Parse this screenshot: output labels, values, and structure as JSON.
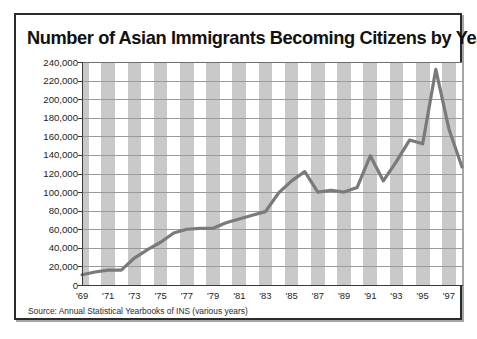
{
  "figure": {
    "title": "Number of Asian Immigrants Becoming Citizens by Year",
    "source": "Source: Annual Statistical Yearbooks of INS (various years)",
    "line_color": "#7a7a7a",
    "band_color": "#c9c9c9",
    "grid_color": "#9a9a9a",
    "frame_color": "#2b2b2b",
    "background": "#ffffff"
  },
  "chart_data": {
    "type": "line",
    "title": "Number of Asian Immigrants Becoming Citizens by Year",
    "subtitle": "",
    "xlabel": "",
    "ylabel": "",
    "ylim": [
      0,
      240000
    ],
    "xlim": [
      1969,
      1998
    ],
    "grid": true,
    "legend": false,
    "legend_position": "none",
    "y_ticks": [
      0,
      20000,
      40000,
      60000,
      80000,
      100000,
      120000,
      140000,
      160000,
      180000,
      200000,
      220000,
      240000
    ],
    "y_ticklabels": [
      "0",
      "20,000",
      "40,000",
      "60,000",
      "80,000",
      "100,000",
      "120,000",
      "140,000",
      "160,000",
      "180,000",
      "200,000",
      "220,000",
      "240,000"
    ],
    "x_ticks": [
      1969,
      1971,
      1973,
      1975,
      1977,
      1979,
      1981,
      1983,
      1985,
      1987,
      1989,
      1991,
      1993,
      1995,
      1997
    ],
    "x_ticklabels": [
      "'69",
      "'71",
      "'73",
      "'75",
      "'77",
      "'79",
      "'81",
      "'83",
      "'85",
      "'87",
      "'89",
      "'91",
      "'93",
      "'95",
      "'97"
    ],
    "x": [
      1969,
      1970,
      1971,
      1972,
      1973,
      1974,
      1975,
      1976,
      1977,
      1978,
      1979,
      1980,
      1981,
      1982,
      1983,
      1984,
      1985,
      1986,
      1987,
      1988,
      1989,
      1990,
      1991,
      1992,
      1993,
      1994,
      1995,
      1996,
      1997,
      1998
    ],
    "series": [
      {
        "name": "Asian immigrants becoming citizens",
        "values": [
          11000,
          14000,
          16000,
          16000,
          29000,
          38000,
          46000,
          56000,
          60000,
          61000,
          61000,
          67000,
          71000,
          75000,
          79000,
          99000,
          112000,
          122000,
          100000,
          102000,
          100000,
          105000,
          139000,
          112000,
          133000,
          156000,
          152000,
          232000,
          168000,
          127000
        ]
      }
    ],
    "annotations": []
  },
  "x_bands": [
    {
      "label": "'69",
      "shaded": true
    },
    {
      "label": "'71",
      "shaded": true
    },
    {
      "label": "'73",
      "shaded": true
    },
    {
      "label": "'75",
      "shaded": true
    },
    {
      "label": "'77",
      "shaded": true
    },
    {
      "label": "'79",
      "shaded": true
    },
    {
      "label": "'81",
      "shaded": true
    },
    {
      "label": "'83",
      "shaded": true
    },
    {
      "label": "'85",
      "shaded": true
    },
    {
      "label": "'87",
      "shaded": true
    },
    {
      "label": "'89",
      "shaded": true
    },
    {
      "label": "'91",
      "shaded": true
    },
    {
      "label": "'93",
      "shaded": true
    },
    {
      "label": "'95",
      "shaded": true
    },
    {
      "label": "'97",
      "shaded": true
    }
  ]
}
